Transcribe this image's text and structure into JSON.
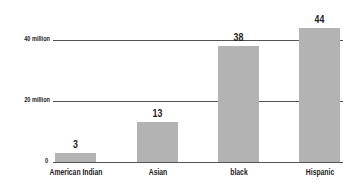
{
  "chart_data": {
    "type": "bar",
    "title": "",
    "xlabel": "",
    "ylabel": "",
    "categories": [
      "American Indian",
      "Asian",
      "black",
      "Hispanic"
    ],
    "values": [
      3,
      13,
      38,
      44
    ],
    "value_labels": [
      "3",
      "13",
      "38",
      "44"
    ],
    "unit": "million",
    "ylim": [
      0,
      47
    ],
    "yticks": [
      0,
      20,
      40
    ],
    "ytick_labels": [
      "0",
      "20 million",
      "40 million"
    ],
    "grid": true,
    "bar_color": "#b3b3b3",
    "legend": null
  }
}
